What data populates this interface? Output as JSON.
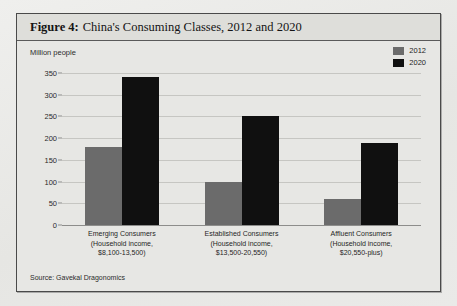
{
  "figure": {
    "label": "Figure 4:",
    "title": "China's Consuming Classes, 2012 and 2020",
    "unit_label": "Million people",
    "source": "Source: Gavekal Dragonomics"
  },
  "colors": {
    "series_2012": "#6b6b6b",
    "series_2020": "#101010",
    "panel_bg": "#e7e7e4",
    "border": "#4a4a4a",
    "gridline": "#c6c6c2"
  },
  "legend": {
    "position": "top-right",
    "items": [
      {
        "label": "2012",
        "color": "#6b6b6b"
      },
      {
        "label": "2020",
        "color": "#101010"
      }
    ]
  },
  "chart_data": {
    "type": "bar",
    "title": "China's Consuming Classes, 2012 and 2020",
    "xlabel": "",
    "ylabel": "Million people",
    "ylim": [
      0,
      350
    ],
    "yticks": [
      0,
      50,
      100,
      150,
      200,
      250,
      300,
      350
    ],
    "grid": true,
    "categories": [
      "Emerging Consumers\n(Household income,\n$8,100-13,500)",
      "Established Consumers\n(Household income,\n$13,500-20,550)",
      "Affluent Consumers\n(Household income,\n$20,550-plus)"
    ],
    "category_lines": [
      [
        "Emerging Consumers",
        "(Household income,",
        "$8,100-13,500)"
      ],
      [
        "Established Consumers",
        "(Household income,",
        "$13,500-20,550)"
      ],
      [
        "Affluent Consumers",
        "(Household income,",
        "$20,550-plus)"
      ]
    ],
    "series": [
      {
        "name": "2012",
        "color": "#6b6b6b",
        "values": [
          180,
          100,
          60
        ]
      },
      {
        "name": "2020",
        "color": "#101010",
        "values": [
          340,
          250,
          190
        ]
      }
    ]
  }
}
